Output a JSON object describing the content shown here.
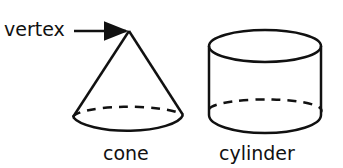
{
  "diagram": {
    "labels": {
      "vertex": "vertex",
      "cone": "cone",
      "cylinder": "cylinder"
    },
    "shapes": [
      "cone",
      "cylinder"
    ],
    "colors": {
      "stroke": "#111111",
      "background": "#ffffff"
    }
  }
}
